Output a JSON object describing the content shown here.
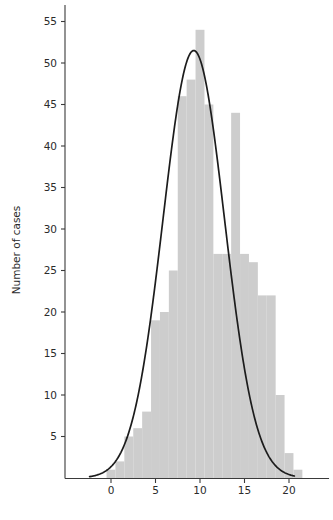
{
  "chart_data": {
    "type": "bar",
    "title": "",
    "subtitle": "",
    "xlabel": "",
    "ylabel": "Number of cases",
    "xlim": [
      -4.5,
      24.5
    ],
    "ylim": [
      0,
      57
    ],
    "grid": false,
    "legend": null,
    "bar_color": "#cdcdcd",
    "curve_color": "#1c1c1c",
    "axis_color": "#3a3a3a",
    "x_ticks": [
      0,
      5,
      10,
      15,
      20
    ],
    "x_tick_labels": [
      "0",
      "5",
      "10",
      "15",
      "20"
    ],
    "y_ticks": [
      5,
      10,
      15,
      20,
      25,
      30,
      35,
      40,
      45,
      50,
      55
    ],
    "y_tick_labels": [
      "5",
      "10",
      "15",
      "20",
      "25",
      "30",
      "35",
      "40",
      "45",
      "50",
      "55"
    ],
    "bin_width": 1,
    "categories": [
      0,
      1,
      2,
      3,
      4,
      5,
      6,
      7,
      8,
      9,
      10,
      11,
      12,
      13,
      14,
      15,
      16,
      17,
      18,
      19,
      20,
      21
    ],
    "values": [
      1,
      2,
      5,
      6,
      8,
      19,
      20,
      25,
      46,
      48,
      54,
      45,
      27,
      27,
      44,
      27,
      26,
      22,
      22,
      10,
      3,
      1
    ],
    "series": [
      {
        "name": "Number of cases",
        "type": "bar",
        "values": [
          1,
          2,
          5,
          6,
          8,
          19,
          20,
          25,
          46,
          48,
          54,
          45,
          27,
          27,
          44,
          27,
          26,
          22,
          22,
          10,
          3,
          1
        ]
      },
      {
        "name": "Normal curve",
        "type": "line",
        "peak_x": 9.3,
        "peak_y": 51.5,
        "mean": 9.3,
        "sigma": 3.45,
        "amplitude": 51.5,
        "x_start": -2.4,
        "x_end": 20.6
      }
    ]
  },
  "axes": {
    "y_title": "Number of cases"
  }
}
